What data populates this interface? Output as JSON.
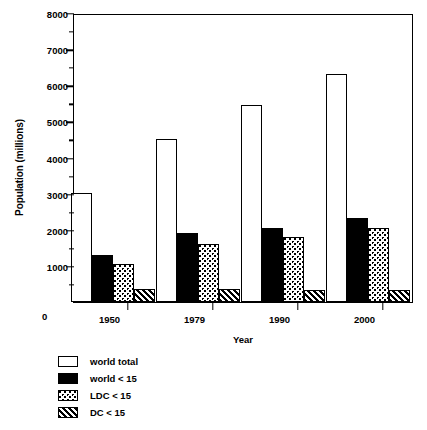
{
  "chart_data": {
    "type": "bar",
    "title": "",
    "xlabel": "Year",
    "ylabel": "Population (millions)",
    "categories": [
      "1950",
      "1979",
      "1990",
      "2000"
    ],
    "series": [
      {
        "name": "world total",
        "fill": "white",
        "values": [
          3020,
          4500,
          5450,
          6300
        ]
      },
      {
        "name": "world < 15",
        "fill": "black",
        "values": [
          1300,
          1900,
          2050,
          2320
        ]
      },
      {
        "name": "LDC < 15",
        "fill": "dotted",
        "values": [
          1050,
          1600,
          1800,
          2050
        ]
      },
      {
        "name": "DC < 15",
        "fill": "hatched",
        "values": [
          350,
          370,
          320,
          330
        ]
      }
    ],
    "ylim": [
      0,
      8000
    ],
    "ytick_labels": [
      "0",
      "1000",
      "2000",
      "3000",
      "4000",
      "5000",
      "6000",
      "7000",
      "8000"
    ],
    "ytick_values": [
      0,
      1000,
      2000,
      3000,
      4000,
      5000,
      6000,
      7000,
      8000
    ],
    "yminor_step": 500,
    "grid": false,
    "legend_position": "below-left",
    "frame": "box",
    "axis_color": "#000000",
    "background": "#ffffff"
  },
  "legend": {
    "items": [
      {
        "label": "world total"
      },
      {
        "label": "world < 15"
      },
      {
        "label": "LDC < 15"
      },
      {
        "label": "DC < 15"
      }
    ]
  }
}
